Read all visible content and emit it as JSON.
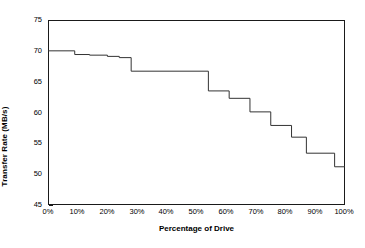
{
  "chart_data": {
    "type": "line",
    "title": "",
    "xlabel": "Percentage of Drive",
    "ylabel": "Transfer Rate (MB/s)",
    "xlim": [
      0,
      100
    ],
    "ylim": [
      45,
      75
    ],
    "grid": false,
    "legend": null,
    "x_tick_labels": [
      "0%",
      "10%",
      "20%",
      "30%",
      "40%",
      "50%",
      "60%",
      "70%",
      "80%",
      "90%",
      "100%"
    ],
    "x_ticks": [
      0,
      10,
      20,
      30,
      40,
      50,
      60,
      70,
      80,
      90,
      100
    ],
    "y_tick_labels": [
      "45",
      "50",
      "55",
      "60",
      "65",
      "70",
      "75"
    ],
    "y_ticks": [
      45,
      50,
      55,
      60,
      65,
      70,
      75
    ],
    "line_color": "#333333",
    "series": [
      {
        "name": "Transfer Rate",
        "step_style": "post",
        "x": [
          0,
          9,
          14,
          20,
          24,
          28,
          54,
          61,
          68,
          75,
          82,
          87,
          96.5,
          100
        ],
        "values": [
          70.0,
          69.4,
          69.3,
          69.1,
          68.9,
          66.7,
          63.5,
          62.3,
          60.1,
          57.9,
          56.0,
          53.4,
          51.2,
          51.2
        ]
      }
    ],
    "segments": [
      {
        "x_start": 0,
        "x_end": 9,
        "value": 70.0
      },
      {
        "x_start": 9,
        "x_end": 14,
        "value": 69.4
      },
      {
        "x_start": 14,
        "x_end": 20,
        "value": 69.3
      },
      {
        "x_start": 20,
        "x_end": 24,
        "value": 69.1
      },
      {
        "x_start": 24,
        "x_end": 28,
        "value": 68.9
      },
      {
        "x_start": 28,
        "x_end": 54,
        "value": 66.7
      },
      {
        "x_start": 54,
        "x_end": 61,
        "value": 63.5
      },
      {
        "x_start": 61,
        "x_end": 68,
        "value": 62.3
      },
      {
        "x_start": 68,
        "x_end": 75,
        "value": 60.1
      },
      {
        "x_start": 75,
        "x_end": 82,
        "value": 57.9
      },
      {
        "x_start": 82,
        "x_end": 87,
        "value": 56.0
      },
      {
        "x_start": 87,
        "x_end": 96.5,
        "value": 53.4
      },
      {
        "x_start": 96.5,
        "x_end": 100,
        "value": 51.2
      }
    ]
  },
  "axes": {
    "x_title": "Percentage of Drive",
    "y_title": "Transfer Rate (MB/s)",
    "y_labels": {
      "t0": "45",
      "t1": "50",
      "t2": "55",
      "t3": "60",
      "t4": "65",
      "t5": "70",
      "t6": "75"
    },
    "x_labels": {
      "t0": "0%",
      "t1": "10%",
      "t2": "20%",
      "t3": "30%",
      "t4": "40%",
      "t5": "50%",
      "t6": "60%",
      "t7": "70%",
      "t8": "80%",
      "t9": "90%",
      "t10": "100%"
    }
  }
}
